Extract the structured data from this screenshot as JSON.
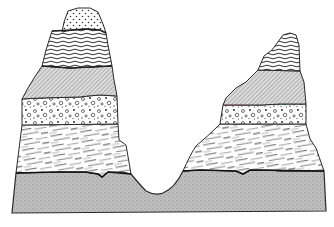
{
  "diagram": {
    "type": "geological-cross-section",
    "colors": {
      "background": "#ffffff",
      "outline": "#2a2a2a",
      "base_fill": "#b9b9b9",
      "hatch_fill": "#d4d4d4",
      "line": "#555555",
      "accent_red": "#d9445a"
    },
    "layers": [
      {
        "id": "cap",
        "pattern": "dotted",
        "present_on": [
          "left-peak"
        ]
      },
      {
        "id": "wavy",
        "pattern": "wavy-lines",
        "present_on": [
          "left-peak",
          "right-peak"
        ]
      },
      {
        "id": "hatched",
        "pattern": "diagonal-hatch",
        "present_on": [
          "left-peak",
          "right-peak"
        ]
      },
      {
        "id": "conglomerate",
        "pattern": "pebbles",
        "present_on": [
          "left-peak",
          "right-peak"
        ]
      },
      {
        "id": "shale",
        "pattern": "streaks",
        "present_on": [
          "left-peak",
          "right-peak"
        ]
      },
      {
        "id": "basement",
        "pattern": "stipple-gray",
        "present_on": [
          "whole-section"
        ]
      }
    ],
    "features": [
      "left-peak",
      "right-peak",
      "valley"
    ]
  }
}
